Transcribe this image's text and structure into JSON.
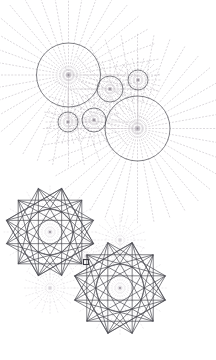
{
  "document": {
    "title": "Geometric Construction Diagram",
    "width": 216,
    "height": 360,
    "background_color": "#ffffff"
  },
  "style": {
    "solid_stroke_color": "#4a4a52",
    "solid_stroke_width": 0.7,
    "dotted_stroke_color": "#b9b3bb",
    "dotted_stroke_width": 0.5,
    "faint_stroke_color": "#d6d2d8",
    "faint_stroke_width": 0.45,
    "guide_stroke_color": "#c9c4cb",
    "dash_pattern": "1.2 2.2",
    "center_dot_color": "#8f8a93",
    "center_dot_radius": 0.9
  },
  "panels": [
    {
      "name": "upper-circle-cluster",
      "description": "Apollonian-style tangent circle arrangement with radiating dotted spokes"
    },
    {
      "name": "lower-star-cluster",
      "description": "Two interlaced twelve-pointed star polygons with construction guides"
    }
  ],
  "circles": [
    {
      "id": "big-circle-upper-left",
      "cx": 68.5,
      "cy": 75.0,
      "r": 32.0,
      "spokes": 36,
      "spoke_extent": 2.9,
      "ring": true
    },
    {
      "id": "big-circle-right",
      "cx": 137.5,
      "cy": 128.5,
      "r": 32.5,
      "spokes": 36,
      "spoke_extent": 2.9,
      "ring": true
    },
    {
      "id": "medium-circle-center",
      "cx": 110.0,
      "cy": 89.0,
      "r": 13.0,
      "spokes": 24,
      "spoke_extent": 2.2,
      "ring": true
    },
    {
      "id": "small-circle-top-right",
      "cx": 138.0,
      "cy": 80.0,
      "r": 10.0,
      "spokes": 24,
      "spoke_extent": 2.4,
      "ring": true
    },
    {
      "id": "small-circle-mid-left",
      "cx": 94.0,
      "cy": 120.0,
      "r": 12.0,
      "spokes": 24,
      "spoke_extent": 2.2,
      "ring": true
    },
    {
      "id": "small-circle-bottom",
      "cx": 68.0,
      "cy": 122.0,
      "r": 10.0,
      "spokes": 24,
      "spoke_extent": 2.4,
      "ring": true
    }
  ],
  "connector_rects": [
    {
      "id": "rect-upper",
      "x1": 68.5,
      "y1": 75.0,
      "x2": 137.5,
      "y2": 128.5
    },
    {
      "id": "rect-small",
      "x1": 68.0,
      "y1": 89.0,
      "x2": 138.0,
      "y2": 122.0
    }
  ],
  "stars": [
    {
      "id": "star-upper-left",
      "cx": 50.0,
      "cy": 232.0,
      "outer_r": 45.0,
      "points": 12,
      "skips": [
        5,
        4,
        3
      ],
      "rotation_deg": 15,
      "inner_circle_r": 23.0,
      "bounding_square_r": 32.0
    },
    {
      "id": "star-lower-right",
      "cx": 120.0,
      "cy": 288.0,
      "outer_r": 47.0,
      "points": 12,
      "skips": [
        5,
        4,
        3
      ],
      "rotation_deg": 15,
      "inner_circle_r": 24.0,
      "bounding_square_r": 33.0
    }
  ],
  "guide_circles": [
    {
      "id": "guide-star-upper-center",
      "cx": 50.0,
      "cy": 232.0,
      "r": 23.0,
      "spokes": 24,
      "spoke_extent": 2.0
    },
    {
      "id": "guide-star-lower-center",
      "cx": 120.0,
      "cy": 288.0,
      "r": 24.0,
      "spokes": 24,
      "spoke_extent": 2.0
    },
    {
      "id": "guide-small-between",
      "cx": 120.0,
      "cy": 240.0,
      "r": 14.0,
      "spokes": 20,
      "spoke_extent": 1.9
    },
    {
      "id": "guide-small-left-low",
      "cx": 50.0,
      "cy": 288.0,
      "r": 14.0,
      "spokes": 20,
      "spoke_extent": 1.9
    },
    {
      "id": "guide-small-node",
      "cx": 86.0,
      "cy": 256.0,
      "r": 9.0,
      "spokes": 16,
      "spoke_extent": 2.0
    }
  ],
  "marker": {
    "id": "node-marker",
    "cx": 86.0,
    "cy": 262.0,
    "size": 5.0,
    "color": "#3a3a42"
  },
  "labels": {
    "figure_caption": "Tangent circle and twelve-point star construction"
  }
}
